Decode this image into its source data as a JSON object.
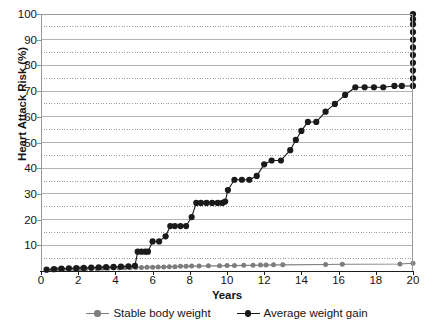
{
  "chart_data": {
    "type": "line",
    "title": "",
    "xlabel": "Years",
    "ylabel": "Heart Attack Risk (%)",
    "xlim": [
      0,
      20
    ],
    "ylim": [
      0,
      100
    ],
    "xticks": [
      0,
      2,
      4,
      6,
      8,
      10,
      12,
      14,
      16,
      18,
      20
    ],
    "yticks": [
      0,
      10,
      20,
      30,
      40,
      50,
      60,
      70,
      80,
      90,
      100
    ],
    "ytick_labels": [
      "",
      "10",
      "20",
      "30",
      "40",
      "50",
      "60",
      "70",
      "80",
      "90",
      "100"
    ],
    "minor_yticks": [
      5,
      15,
      25,
      35,
      45,
      55,
      65,
      75,
      85,
      95
    ],
    "grid": "major solid horizontal, minor dotted horizontal",
    "legend_position": "below x-axis label, centered",
    "series": [
      {
        "name": "Stable body weight",
        "color": "#7d7d7d",
        "marker": "circle",
        "x": [
          0.3,
          0.6,
          0.9,
          1.2,
          1.5,
          1.8,
          2.1,
          2.4,
          2.7,
          3.0,
          3.3,
          3.6,
          3.9,
          4.2,
          4.5,
          4.8,
          5.1,
          5.4,
          5.7,
          6.0,
          6.3,
          6.6,
          6.9,
          7.2,
          7.5,
          7.8,
          8.1,
          8.5,
          9.0,
          9.6,
          10.0,
          10.4,
          10.9,
          11.4,
          11.8,
          12.1,
          12.5,
          13.0,
          15.3,
          16.2,
          19.3,
          20.0
        ],
        "y": [
          0.4,
          0.5,
          0.6,
          0.7,
          0.8,
          0.8,
          0.9,
          0.9,
          1.0,
          1.0,
          1.1,
          1.1,
          1.2,
          1.2,
          1.3,
          1.3,
          1.4,
          1.4,
          1.5,
          1.5,
          1.6,
          1.6,
          1.7,
          1.7,
          1.8,
          1.8,
          1.9,
          1.9,
          2.0,
          2.0,
          2.1,
          2.1,
          2.2,
          2.2,
          2.3,
          2.3,
          2.4,
          2.4,
          2.5,
          2.6,
          2.7,
          3.0
        ]
      },
      {
        "name": "Average weight gain",
        "color": "#1a1a1a",
        "marker": "circle",
        "x": [
          0.3,
          0.7,
          1.1,
          1.5,
          1.9,
          2.3,
          2.7,
          3.1,
          3.5,
          3.9,
          4.3,
          4.7,
          5.05,
          5.2,
          5.4,
          5.6,
          5.75,
          6.0,
          6.35,
          6.7,
          6.95,
          7.2,
          7.5,
          7.8,
          8.1,
          8.35,
          8.6,
          8.9,
          9.2,
          9.5,
          9.75,
          9.9,
          10.05,
          10.4,
          10.8,
          11.2,
          11.6,
          12.0,
          12.4,
          12.9,
          13.4,
          13.7,
          14.0,
          14.35,
          14.8,
          15.3,
          15.8,
          16.35,
          16.9,
          17.4,
          17.9,
          18.4,
          19.0,
          19.4,
          20.0,
          20.0,
          20.0,
          20.0,
          20.0,
          20.0,
          20.0,
          20.0,
          20.0,
          20.0,
          20.0
        ],
        "y": [
          0.5,
          0.7,
          0.9,
          1.0,
          1.1,
          1.2,
          1.3,
          1.4,
          1.5,
          1.6,
          1.7,
          1.8,
          2.0,
          7.5,
          7.5,
          7.5,
          7.5,
          11.5,
          11.5,
          13.5,
          17.5,
          17.5,
          17.5,
          17.5,
          21.0,
          26.5,
          26.5,
          26.5,
          26.5,
          26.5,
          26.5,
          27.0,
          31.5,
          35.5,
          35.5,
          35.5,
          37.0,
          41.5,
          43.0,
          43.0,
          47.0,
          51.0,
          54.5,
          58.0,
          58.0,
          62.0,
          65.0,
          68.5,
          71.5,
          71.5,
          71.5,
          71.5,
          72.0,
          72.0,
          72.0,
          75.0,
          78.0,
          81.0,
          84.0,
          87.0,
          90.0,
          93.0,
          96.0,
          98.0,
          100.0
        ]
      }
    ]
  },
  "legend": {
    "items": [
      {
        "label": "Stable body weight",
        "color": "#7d7d7d"
      },
      {
        "label": "Average weight gain",
        "color": "#1a1a1a"
      }
    ]
  },
  "axes": {
    "y_title": "Heart Attack Risk (%)",
    "x_title": "Years",
    "y_labels": [
      "100",
      "90",
      "80",
      "70",
      "60",
      "50",
      "40",
      "30",
      "20",
      "10"
    ],
    "x_labels": [
      "0",
      "2",
      "4",
      "6",
      "8",
      "10",
      "12",
      "14",
      "16",
      "18",
      "20"
    ]
  },
  "colors": {
    "series_stable": "#7d7d7d",
    "series_gain": "#1a1a1a",
    "grid_major": "#b4b4b4",
    "grid_minor": "#9c9c9c",
    "frame": "#9a9a9a",
    "axis": "#1c1c1c",
    "text": "#141414",
    "background": "#ffffff"
  }
}
